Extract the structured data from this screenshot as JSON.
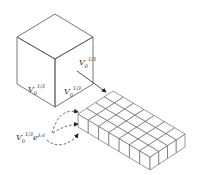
{
  "figure": {
    "cube": {
      "faces": {
        "left_label": {
          "base": "V",
          "sub": "0",
          "sup": "1/3"
        },
        "right_label": {
          "base": "V",
          "sub": "0",
          "sup": "1/3"
        },
        "side_label": {
          "base": "V",
          "sub": "0",
          "sup": "1/3"
        }
      }
    },
    "slab": {
      "rows": 4,
      "columns": 7
    },
    "source_label": {
      "base": "V",
      "sub": "0",
      "sup": "1/3",
      "exp_base": "e",
      "exp": "λ₀t"
    },
    "colors": {
      "line": "#555555",
      "background": "#ffffff"
    }
  }
}
